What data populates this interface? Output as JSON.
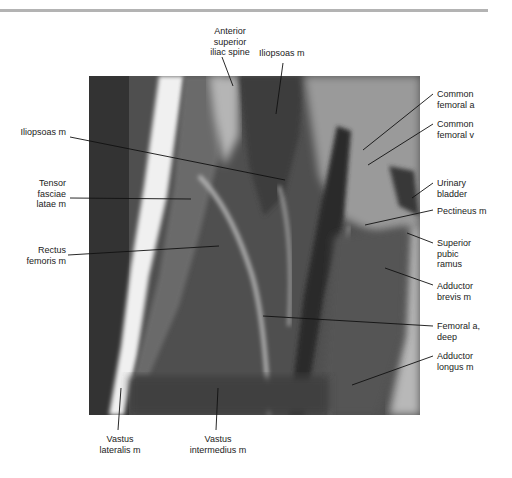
{
  "figure": {
    "type": "MRI coronal/sagittal thigh slice with anatomical labels",
    "colors": {
      "background": "#ffffff",
      "rule": "#b3b3b3",
      "label_text": "#222222"
    }
  },
  "labels": {
    "asis": "Anterior superior iliac spine",
    "asis_lines": [
      "Anterior",
      "superior",
      "iliac spine"
    ],
    "iliopsoas_top": "Iliopsoas m",
    "iliopsoas_left": "Iliopsoas m",
    "tfl_lines": [
      "Tensor",
      "fasciae",
      "latae m"
    ],
    "rectus_lines": [
      "Rectus",
      "femoris m"
    ],
    "cfa_lines": [
      "Common",
      "femoral a"
    ],
    "cfv_lines": [
      "Common",
      "femoral v"
    ],
    "bladder_lines": [
      "Urinary",
      "bladder"
    ],
    "pectineus": "Pectineus m",
    "spr_lines": [
      "Superior",
      "pubic",
      "ramus"
    ],
    "addbrev_lines": [
      "Adductor",
      "brevis m"
    ],
    "deepfem_lines": [
      "Femoral a,",
      "deep"
    ],
    "addlong_lines": [
      "Adductor",
      "longus m"
    ],
    "vl_lines": [
      "Vastus",
      "lateralis m"
    ],
    "vi_lines": [
      "Vastus",
      "intermedius m"
    ]
  }
}
